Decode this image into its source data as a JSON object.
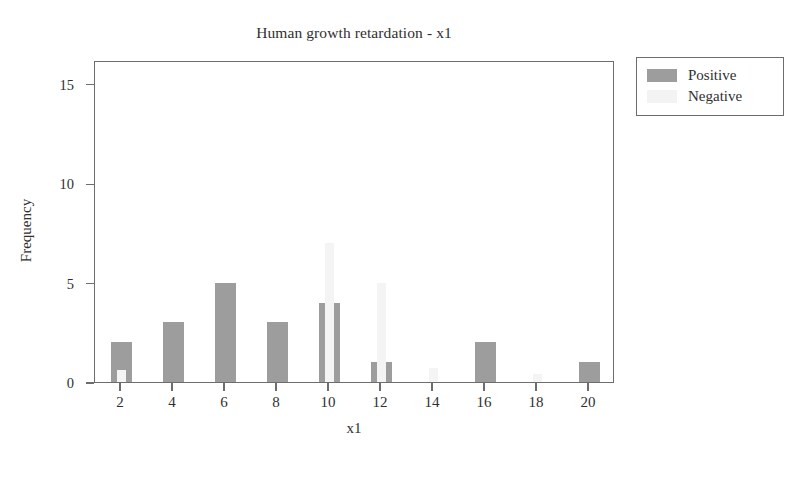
{
  "chart_data": {
    "type": "bar",
    "title": "Human growth retardation - x1",
    "subtitle": "",
    "xlabel": "x1",
    "ylabel": "Frequency",
    "stacked": true,
    "grid": false,
    "legend_position": "right-outside",
    "categories": [
      2,
      4,
      6,
      8,
      10,
      12,
      14,
      16,
      18,
      20
    ],
    "xtick_labels": [
      "2",
      "4",
      "6",
      "8",
      "10",
      "12",
      "14",
      "16",
      "18",
      "20"
    ],
    "ytick_labels": [
      "0",
      "5",
      "10",
      "15"
    ],
    "ytick_values": [
      0,
      5,
      10,
      15
    ],
    "xlim": [
      1,
      21
    ],
    "ylim": [
      0,
      16.2
    ],
    "series": [
      {
        "name": "Positive",
        "color": "#9d9d9d",
        "values": [
          2,
          3,
          5,
          3,
          4,
          1,
          0,
          2,
          0,
          1
        ]
      },
      {
        "name": "Negative",
        "color": "#f3f3f3",
        "values": [
          0.6,
          0,
          0,
          0,
          7,
          5,
          0.7,
          0,
          0.4,
          0
        ]
      }
    ]
  },
  "legend": {
    "items": [
      {
        "label": "Positive",
        "swatch": "positive-swatch"
      },
      {
        "label": "Negative",
        "swatch": "negative-swatch"
      }
    ]
  },
  "colors": {
    "positive": "#9d9d9d",
    "negative": "#f3f3f3",
    "axis": "#6d6d6d",
    "text": "#2f2f2f",
    "background": "#ffffff"
  }
}
